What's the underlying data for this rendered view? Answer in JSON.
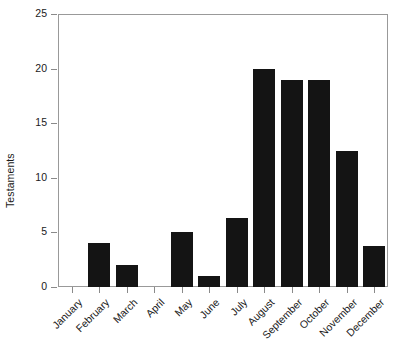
{
  "chart_data": {
    "type": "bar",
    "title": "",
    "subtitle": "",
    "xlabel": "",
    "ylabel": "Testaments",
    "categories": [
      "January",
      "February",
      "March",
      "April",
      "May",
      "June",
      "July",
      "August",
      "September",
      "October",
      "November",
      "December"
    ],
    "values": [
      0,
      4,
      2,
      0,
      5,
      1,
      6.3,
      20,
      19,
      19,
      12.5,
      3.8
    ],
    "ylim": [
      0,
      25
    ],
    "yticks": [
      0,
      5,
      10,
      15,
      20,
      25
    ],
    "ytick_labels": [
      "0",
      "5",
      "10",
      "15",
      "20",
      "25"
    ],
    "grid": false,
    "legend": null,
    "bar_color": "#141414",
    "background_color": "#ffffff",
    "frame_color": "#999999",
    "xtick_label_rotation": -45,
    "annotations": []
  }
}
